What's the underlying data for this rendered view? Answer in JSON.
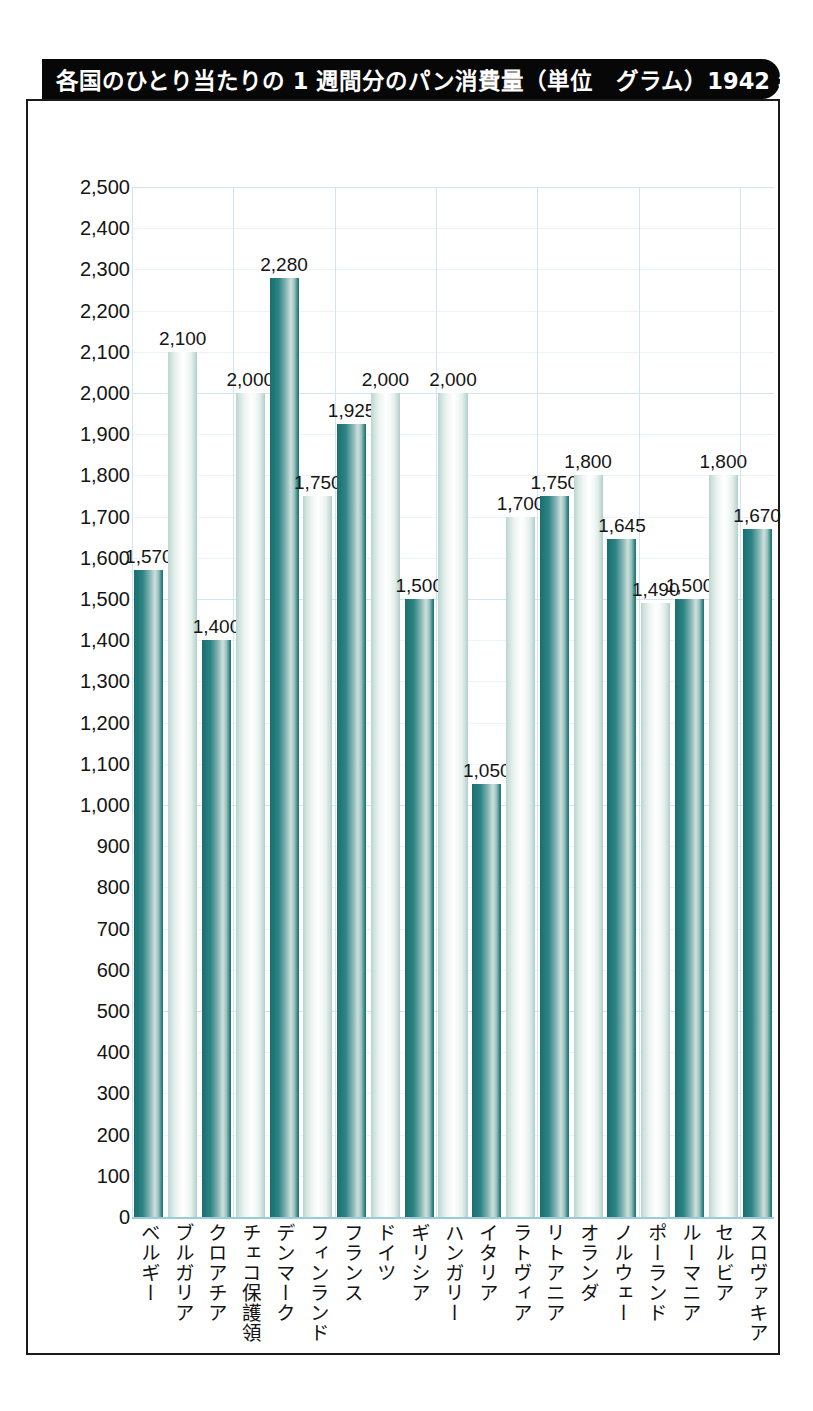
{
  "scan_fragment": "ﾟ ﾞ ﾞ    ﾟ ﾞ ﾞ",
  "title": "各国のひとり当たりの 1 週間分のパン消費量（単位　グラム）1942 年",
  "colors": {
    "title_bar": "#070707",
    "frame": "#1b1b1b",
    "grid": "#cfe5ef",
    "bar_dark": "#1b6e6e",
    "bar_light": "#ffffff",
    "text": "#151515"
  },
  "chart_data": {
    "type": "bar",
    "title": "各国のひとり当たりの 1 週間分のパン消費量（単位　グラム）1942 年",
    "xlabel": "",
    "ylabel": "",
    "ylim": [
      0,
      2500
    ],
    "ytick_step": 100,
    "grid": true,
    "legend": "none",
    "ytick_labels": [
      "2,500",
      "2,400",
      "2,300",
      "2,200",
      "2,100",
      "2,000",
      "1,900",
      "1,800",
      "1,700",
      "1,600",
      "1,500",
      "1,400",
      "1,300",
      "1,200",
      "1,100",
      "1,000",
      "900",
      "800",
      "700",
      "600",
      "500",
      "400",
      "300",
      "200",
      "100",
      "0"
    ],
    "categories": [
      "ベルギー",
      "ブルガリア",
      "クロアチア",
      "チェコ保護領",
      "デンマーク",
      "フィンランド",
      "フランス",
      "ドイツ",
      "ギリシア",
      "ハンガリー",
      "イタリア",
      "ラトヴィア",
      "リトアニア",
      "オランダ",
      "ノルウェー",
      "ポーランド",
      "ルーマニア",
      "セルビア",
      "スロヴァキア"
    ],
    "values": [
      1570,
      2100,
      1400,
      2000,
      2280,
      1750,
      1925,
      2000,
      1500,
      2000,
      1050,
      1700,
      1750,
      1800,
      1645,
      1490,
      1500,
      1800,
      1670
    ],
    "value_labels": [
      "1,570",
      "2,100",
      "1,400",
      "2,000",
      "2,280",
      "1,750",
      "1,925",
      "2,000",
      "1,500",
      "2,000",
      "1,050",
      "1,700",
      "1,750",
      "1,800",
      "1,645",
      "1,490",
      "1,500",
      "1,800",
      "1,670"
    ],
    "bar_styles": [
      "dark",
      "light",
      "dark",
      "light",
      "dark",
      "light",
      "dark",
      "light",
      "dark",
      "light",
      "dark",
      "light",
      "dark",
      "light",
      "dark",
      "light",
      "dark",
      "light",
      "dark"
    ]
  }
}
